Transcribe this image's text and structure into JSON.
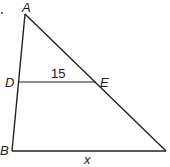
{
  "diagram": {
    "type": "triangle-with-parallel-segment",
    "marker_dot": ".",
    "vertices": {
      "A": {
        "label": "A",
        "x": 25,
        "y": 14
      },
      "B": {
        "label": "B",
        "x": 12,
        "y": 151
      },
      "C": {
        "label": "",
        "x": 166,
        "y": 151
      },
      "D": {
        "label": "D",
        "x": 18,
        "y": 82
      },
      "E": {
        "label": "E",
        "x": 96,
        "y": 82
      }
    },
    "segments": [
      {
        "from": "A",
        "to": "B"
      },
      {
        "from": "A",
        "to": "C"
      },
      {
        "from": "B",
        "to": "C"
      },
      {
        "from": "D",
        "to": "E"
      }
    ],
    "measurements": {
      "DE": "15",
      "BC": "x"
    },
    "colors": {
      "line": "#222222",
      "text": "#1a1a1a",
      "background": "#ffffff"
    }
  }
}
